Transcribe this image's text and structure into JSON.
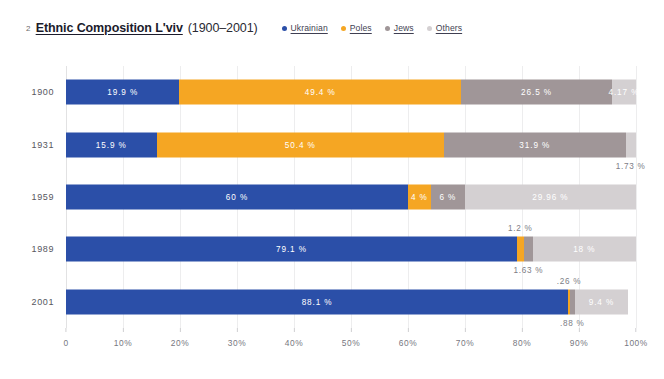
{
  "figure_number": "2",
  "title": {
    "main": "Ethnic Composition L'viv",
    "years": "(1900–2001)"
  },
  "legend": {
    "items": [
      {
        "label": "Ukrainian",
        "color": "#2B4FA8"
      },
      {
        "label": "Poles",
        "color": "#F5A623"
      },
      {
        "label": "Jews",
        "color": "#A09698"
      },
      {
        "label": "Others",
        "color": "#D4D0D2"
      }
    ]
  },
  "colors": {
    "ukrainian": "#2B4FA8",
    "poles": "#F5A623",
    "jews": "#A09698",
    "others": "#D4D0D2",
    "grid": "#ededee",
    "label_text": "#7d7d85"
  },
  "chart_data": {
    "type": "bar",
    "orientation": "horizontal",
    "stacked": true,
    "title": "Ethnic Composition L'viv (1900–2001)",
    "xlabel": "",
    "ylabel": "",
    "xlim": [
      0,
      100
    ],
    "grid": true,
    "legend_position": "top-right",
    "xticks": [
      "0",
      "10%",
      "20%",
      "30%",
      "40%",
      "50%",
      "60%",
      "70%",
      "80%",
      "90%",
      "100%"
    ],
    "xtick_values": [
      0,
      10,
      20,
      30,
      40,
      50,
      60,
      70,
      80,
      90,
      100
    ],
    "categories": [
      "1900",
      "1931",
      "1959",
      "1989",
      "2001"
    ],
    "series": [
      {
        "name": "Ukrainian",
        "color": "#2B4FA8",
        "values": [
          19.9,
          15.9,
          60,
          79.1,
          88.1
        ]
      },
      {
        "name": "Poles",
        "color": "#F5A623",
        "values": [
          49.4,
          50.4,
          4,
          1.2,
          0.26
        ]
      },
      {
        "name": "Jews",
        "color": "#A09698",
        "values": [
          26.5,
          31.9,
          6,
          1.63,
          0.88
        ]
      },
      {
        "name": "Others",
        "color": "#D4D0D2",
        "values": [
          4.17,
          1.73,
          29.96,
          18,
          9.4
        ]
      }
    ],
    "rows": [
      {
        "category": "1900",
        "segments": [
          {
            "series": "Ukrainian",
            "value": 19.9,
            "label": "19.9 %",
            "label_position": "inside"
          },
          {
            "series": "Poles",
            "value": 49.4,
            "label": "49.4 %",
            "label_position": "inside"
          },
          {
            "series": "Jews",
            "value": 26.5,
            "label": "26.5 %",
            "label_position": "inside"
          },
          {
            "series": "Others",
            "value": 4.17,
            "label": "4.17 %",
            "label_position": "inside"
          }
        ]
      },
      {
        "category": "1931",
        "segments": [
          {
            "series": "Ukrainian",
            "value": 15.9,
            "label": "15.9 %",
            "label_position": "inside"
          },
          {
            "series": "Poles",
            "value": 50.4,
            "label": "50.4 %",
            "label_position": "inside"
          },
          {
            "series": "Jews",
            "value": 31.9,
            "label": "31.9 %",
            "label_position": "inside"
          },
          {
            "series": "Others",
            "value": 1.73,
            "label": "1.73 %",
            "label_position": "below"
          }
        ]
      },
      {
        "category": "1959",
        "segments": [
          {
            "series": "Ukrainian",
            "value": 60,
            "label": "60 %",
            "label_position": "inside"
          },
          {
            "series": "Poles",
            "value": 4,
            "label": "4 %",
            "label_position": "inside"
          },
          {
            "series": "Jews",
            "value": 6,
            "label": "6 %",
            "label_position": "inside"
          },
          {
            "series": "Others",
            "value": 29.96,
            "label": "29.96 %",
            "label_position": "inside"
          }
        ]
      },
      {
        "category": "1989",
        "segments": [
          {
            "series": "Ukrainian",
            "value": 79.1,
            "label": "79.1 %",
            "label_position": "inside"
          },
          {
            "series": "Poles",
            "value": 1.2,
            "label": "1.2 %",
            "label_position": "above"
          },
          {
            "series": "Jews",
            "value": 1.63,
            "label": "1.63 %",
            "label_position": "below"
          },
          {
            "series": "Others",
            "value": 18,
            "label": "18 %",
            "label_position": "inside"
          }
        ]
      },
      {
        "category": "2001",
        "segments": [
          {
            "series": "Ukrainian",
            "value": 88.1,
            "label": "88.1 %",
            "label_position": "inside"
          },
          {
            "series": "Poles",
            "value": 0.26,
            "label": ".26 %",
            "label_position": "above"
          },
          {
            "series": "Jews",
            "value": 0.88,
            "label": ".88 %",
            "label_position": "below"
          },
          {
            "series": "Others",
            "value": 9.4,
            "label": "9.4 %",
            "label_position": "inside"
          }
        ]
      }
    ]
  }
}
